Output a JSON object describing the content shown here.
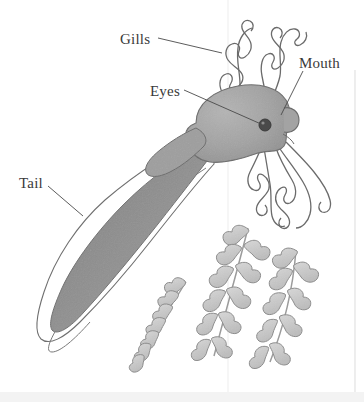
{
  "figure": {
    "style": "grayscale pencil/ink scientific illustration",
    "background_color": "#ffffff"
  },
  "labels": [
    {
      "id": "gills",
      "text": "Gills",
      "text_x": 120,
      "text_y": 40,
      "leader": "M 158 38 L 222 52",
      "target": "external feathery gills on the upper head"
    },
    {
      "id": "eyes",
      "text": "Eyes",
      "text_x": 150,
      "text_y": 92,
      "leader": "M 184 90 L 261 124",
      "target": "dark eye spot on the head"
    },
    {
      "id": "mouth",
      "text": "Mouth",
      "text_x": 300,
      "text_y": 64,
      "leader": "M 302 70 L 281 114",
      "target": "snout and mouth at the front of the head"
    },
    {
      "id": "tail",
      "text": "Tail",
      "text_x": 19,
      "text_y": 184,
      "leader": "M 48 186 L 82 215",
      "target": "finned swimming tail"
    }
  ],
  "colors": {
    "body_fill": "#9b9b9b",
    "body_fill_light": "#aeaeae",
    "tail_core": "#8d8d8d",
    "fin_fill": "#ffffff",
    "outline": "#6b6b6b",
    "leader_line": "#4a4a4a",
    "text": "#3a3a3a",
    "eye": "#3b3b3b",
    "plant_fill": "#c9c9c9",
    "plant_outline": "#8a8a8a",
    "scan_artifact": "#ededed",
    "bottom_band": "#f2f2f2"
  },
  "anatomy": {
    "body": {
      "name": "body",
      "description": "rounded oval trunk and head, mid gray fill"
    },
    "eye": {
      "name": "eye",
      "cx": 265,
      "cy": 125,
      "r": 5.5
    },
    "snout": {
      "name": "snout",
      "description": "small rounded bump at the right front of the head"
    },
    "gills_upper": {
      "name": "upper-gills",
      "count": 2,
      "description": "two branched feathery gill plumes rising from the top of the head"
    },
    "gills_lower": {
      "name": "lower-gills",
      "count": 3,
      "description": "three branched feathery gill plumes hanging below the head"
    },
    "tail": {
      "name": "tail",
      "description": "long tapering tail with pale translucent fin membrane and a darker muscular core"
    }
  },
  "plants": [
    {
      "id": "plant-left",
      "stem": "M 186 282 C 172 302 158 322 146 344",
      "leaf_count": 7,
      "description": "left aquatic plant stem curving down-left with paired leaves"
    },
    {
      "id": "plant-center",
      "stem": "M 247 228 C 236 268 224 308 213 352",
      "leaf_count": 9,
      "description": "center aquatic plant stem with paired leaves"
    },
    {
      "id": "plant-right",
      "stem": "M 294 250 C 290 288 282 324 268 360",
      "leaf_count": 8,
      "description": "right aquatic plant stem with paired leaves"
    }
  ],
  "artifacts": {
    "vertical_scanline_x": 228,
    "right_edge_line_x": 355,
    "bottom_band_y": 392
  }
}
